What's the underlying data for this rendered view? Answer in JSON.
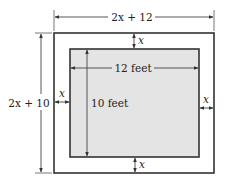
{
  "diagram": {
    "colors": {
      "background": "#ffffff",
      "outer_stroke": "#333333",
      "inner_stroke": "#333333",
      "inner_fill": "#e4e4e4",
      "dimension_line": "#444444",
      "text": "#222222"
    },
    "outer_rect": {
      "x": 54,
      "y": 33,
      "w": 160,
      "h": 140
    },
    "inner_rect": {
      "x": 70,
      "y": 49,
      "w": 129,
      "h": 108
    },
    "labels": {
      "outer_width": "2x + 12",
      "outer_height": "2x + 10",
      "inner_width": "12 feet",
      "inner_height": "10 feet",
      "border_top": "x",
      "border_bottom": "x",
      "border_left": "x",
      "border_right": "x"
    }
  }
}
